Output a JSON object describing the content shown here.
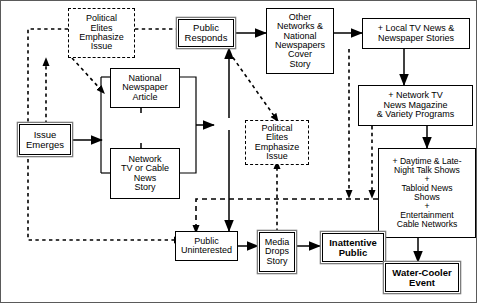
{
  "diagram": {
    "nodes": [
      {
        "id": "political-elites-top",
        "label": "Political\nElites\nEmphasize\nIssue",
        "style": "dashed"
      },
      {
        "id": "public-responds",
        "label": "Public\nResponds",
        "style": "shadow"
      },
      {
        "id": "other-networks",
        "label": "Other\nNetworks &\nNational\nNewspapers\nCover\nStory",
        "style": "solid"
      },
      {
        "id": "local-tv-news",
        "label": "+ Local TV  News &\nNewspaper Stories",
        "style": "solid"
      },
      {
        "id": "national-newspaper",
        "label": "National\nNewspaper\nArticle",
        "style": "solid"
      },
      {
        "id": "network-tv-magazine",
        "label": "+ Network TV\nNews Magazine\n& Variety Programs",
        "style": "solid"
      },
      {
        "id": "issue-emerges",
        "label": "Issue\nEmerges",
        "style": "shadow"
      },
      {
        "id": "political-elites-mid",
        "label": "Political\nElites\nEmphasize\nIssue",
        "style": "dashed"
      },
      {
        "id": "network-tv-cable",
        "label": "Network\nTV or Cable\nNews\nStory",
        "style": "solid"
      },
      {
        "id": "daytime-late-night",
        "label": "+ Daytime & Late-\nNight Talk Shows\n+\nTabloid News\nShows\n+\nEntertainment\nCable Networks",
        "style": "solid"
      },
      {
        "id": "public-uninterested",
        "label": "Public\nUninterested",
        "style": "solid"
      },
      {
        "id": "media-drops-story",
        "label": "Media\nDrops\nStory",
        "style": "solid"
      },
      {
        "id": "inattentive-public",
        "label": "Inattentive\nPublic",
        "style": "shadow"
      },
      {
        "id": "water-cooler-event",
        "label": "Water-Cooler\nEvent",
        "style": "shadow"
      }
    ],
    "colors": {
      "line": "#000000",
      "shadow": "#7d7d7d",
      "frame": "#5a5a5a",
      "background": "#ffffff"
    }
  }
}
